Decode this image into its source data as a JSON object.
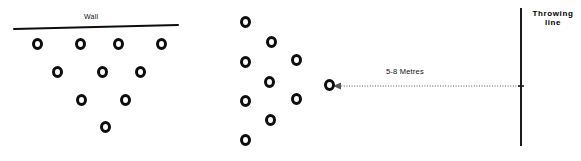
{
  "diagram": {
    "title_labels": {
      "wall": "Wall",
      "distance": "5-8 Metres",
      "throwing_line_1": "Throwing",
      "throwing_line_2": "line"
    },
    "colors": {
      "ink": "#0d0d0d",
      "background": "#ffffff",
      "dotted": "#555555"
    },
    "wall_line": {
      "name": "wall-line",
      "x1": 14,
      "y1": 29,
      "x2": 178,
      "y2": 25
    },
    "throwing_line": {
      "name": "throwing-line",
      "x": 521,
      "y1": 8,
      "y2": 146
    },
    "distance_arrow": {
      "name": "distance-dotted-arrow",
      "x_start": 333,
      "x_end": 520,
      "y": 86,
      "arrowhead": "left"
    },
    "player_group_left": {
      "name": "player-group-left",
      "count": 10,
      "rows": [
        {
          "y": 44,
          "xs": [
            32,
            75,
            113,
            156
          ]
        },
        {
          "y": 72,
          "xs": [
            52,
            97,
            135
          ]
        },
        {
          "y": 100,
          "xs": [
            76,
            120
          ]
        },
        {
          "y": 127,
          "xs": [
            100
          ]
        }
      ]
    },
    "player_group_right": {
      "name": "player-group-right",
      "count": 10,
      "circles": [
        {
          "x": 240,
          "y": 22
        },
        {
          "x": 266,
          "y": 42
        },
        {
          "x": 240,
          "y": 62
        },
        {
          "x": 264,
          "y": 82
        },
        {
          "x": 291,
          "y": 60
        },
        {
          "x": 291,
          "y": 99
        },
        {
          "x": 240,
          "y": 101
        },
        {
          "x": 265,
          "y": 120
        },
        {
          "x": 240,
          "y": 140
        },
        {
          "x": 324,
          "y": 85
        }
      ]
    }
  }
}
